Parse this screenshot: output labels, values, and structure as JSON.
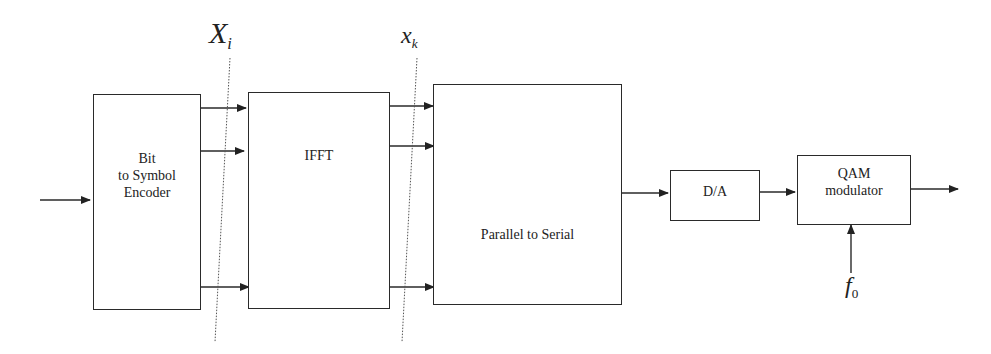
{
  "diagram": {
    "blocks": [
      {
        "id": "encoder",
        "label_lines": [
          "Bit",
          "to Symbol",
          "Encoder"
        ]
      },
      {
        "id": "ifft",
        "label": "IFFT"
      },
      {
        "id": "p2s",
        "label": "Parallel to Serial"
      },
      {
        "id": "dac",
        "label": "D/A"
      },
      {
        "id": "qam",
        "label_lines": [
          "QAM",
          "modulator"
        ]
      }
    ],
    "signals": {
      "freq_domain": {
        "base": "X",
        "sub": "i"
      },
      "time_domain": {
        "base": "x",
        "sub": "k"
      },
      "carrier": {
        "base": "f",
        "sub": "0"
      }
    },
    "connections": [
      {
        "from": "input",
        "to": "encoder"
      },
      {
        "from": "encoder",
        "to": "ifft",
        "lines": 3
      },
      {
        "from": "ifft",
        "to": "p2s",
        "lines": 3
      },
      {
        "from": "p2s",
        "to": "dac"
      },
      {
        "from": "dac",
        "to": "qam"
      },
      {
        "from": "carrier",
        "to": "qam"
      },
      {
        "from": "qam",
        "to": "output"
      }
    ],
    "colors": {
      "line": "#2a2a2a",
      "background": "#ffffff"
    }
  }
}
